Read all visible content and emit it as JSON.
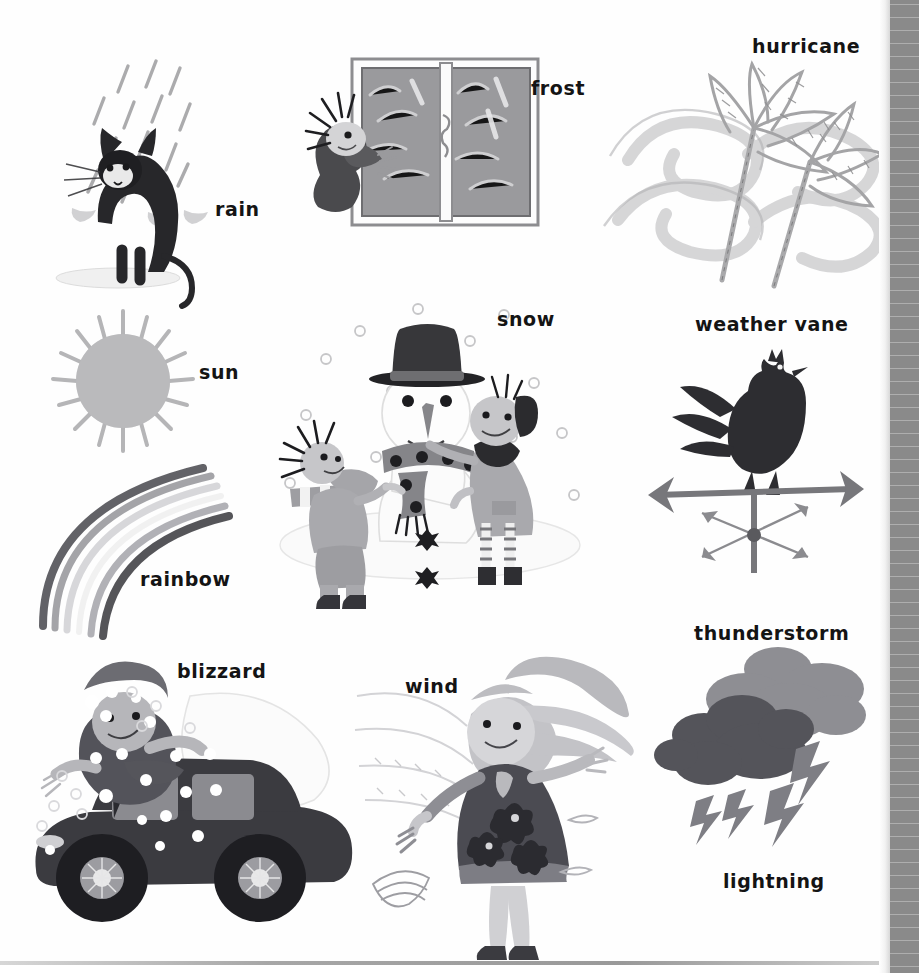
{
  "page": {
    "type": "illustrated-picture-dictionary-page",
    "theme": "weather",
    "background_color": "#ffffff",
    "ink_color": "#141414",
    "book_edge_color": "#8a8a8a"
  },
  "labels": [
    {
      "id": "rain",
      "text": "rain",
      "x": 215,
      "y": 200
    },
    {
      "id": "frost",
      "text": "frost",
      "x": 531,
      "y": 79
    },
    {
      "id": "hurricane",
      "text": "hurricane",
      "x": 752,
      "y": 37
    },
    {
      "id": "sun",
      "text": "sun",
      "x": 199,
      "y": 363
    },
    {
      "id": "snow",
      "text": "snow",
      "x": 497,
      "y": 310
    },
    {
      "id": "weather_vane",
      "text": "weather vane",
      "x": 695,
      "y": 315
    },
    {
      "id": "rainbow",
      "text": "rainbow",
      "x": 140,
      "y": 570
    },
    {
      "id": "blizzard",
      "text": "blizzard",
      "x": 177,
      "y": 662
    },
    {
      "id": "wind",
      "text": "wind",
      "x": 405,
      "y": 677
    },
    {
      "id": "thunderstorm",
      "text": "thunderstorm",
      "x": 694,
      "y": 624
    },
    {
      "id": "lightning",
      "text": "lightning",
      "x": 723,
      "y": 872
    }
  ],
  "illustrations": [
    {
      "id": "rain-cat",
      "name": "black cat in the rain",
      "label_ref": "rain"
    },
    {
      "id": "frost-window",
      "name": "child at frosted window",
      "label_ref": "frost"
    },
    {
      "id": "hurricane-palm",
      "name": "palm trees bending in hurricane",
      "label_ref": "hurricane"
    },
    {
      "id": "sun",
      "name": "sun with rays",
      "label_ref": "sun"
    },
    {
      "id": "snow-scene",
      "name": "two children building a snowman",
      "label_ref": "snow"
    },
    {
      "id": "weather-vane",
      "name": "rooster weather vane",
      "label_ref": "weather_vane"
    },
    {
      "id": "rainbow",
      "name": "arched rainbow",
      "label_ref": "rainbow"
    },
    {
      "id": "blizzard-car",
      "name": "person and car in snow blizzard",
      "label_ref": "blizzard"
    },
    {
      "id": "wind-girl",
      "name": "girl with hair blowing in wind",
      "label_ref": "wind"
    },
    {
      "id": "storm-clouds",
      "name": "storm clouds with lightning bolts",
      "label_ref": "thunderstorm"
    }
  ]
}
